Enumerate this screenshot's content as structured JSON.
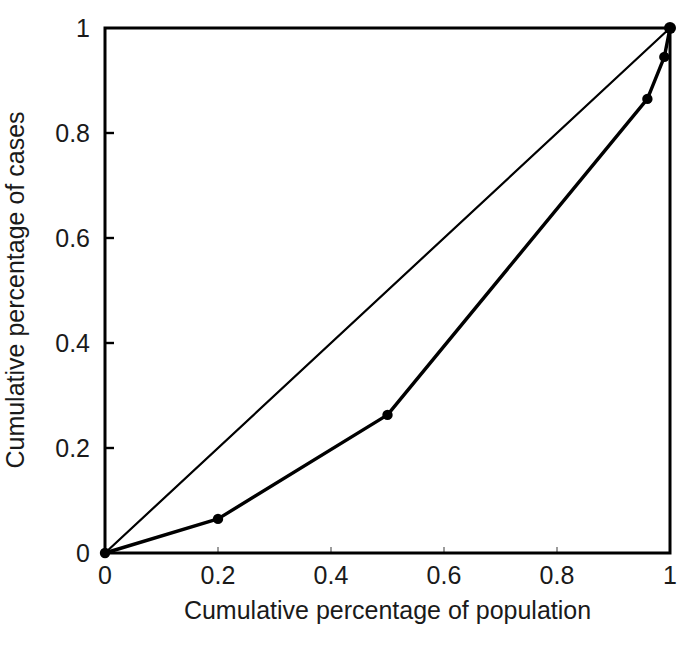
{
  "chart_data": {
    "type": "line",
    "title": "",
    "subtitle": "",
    "xlabel": "Cumulative percentage of population",
    "ylabel": "Cumulative percentage of cases",
    "xlim": [
      0,
      1
    ],
    "ylim": [
      0,
      1
    ],
    "xticks": [
      "0",
      "0.2",
      "0.4",
      "0.6",
      "0.8",
      "1"
    ],
    "xtick_values": [
      0,
      0.2,
      0.4,
      0.6,
      0.8,
      1
    ],
    "yticks": [
      "0",
      "0.2",
      "0.4",
      "0.6",
      "0.8",
      "1"
    ],
    "ytick_values": [
      0,
      0.2,
      0.4,
      0.6,
      0.8,
      1
    ],
    "grid": false,
    "legend": "none",
    "series": [
      {
        "name": "Line of equality",
        "marker": "none",
        "color": "#000000",
        "linewidth": 1.6,
        "x": [
          0,
          1
        ],
        "y": [
          0,
          1
        ]
      },
      {
        "name": "Lorenz curve",
        "marker": "filled-circle",
        "color": "#000000",
        "linewidth": 2.4,
        "x": [
          0,
          0.2,
          0.5,
          0.96,
          0.99,
          1
        ],
        "y": [
          0,
          0.065,
          0.263,
          0.865,
          0.945,
          1
        ]
      }
    ],
    "annotations": []
  },
  "axes": {
    "frame_color": "#000000",
    "background": "#ffffff",
    "tick_direction": "in"
  }
}
